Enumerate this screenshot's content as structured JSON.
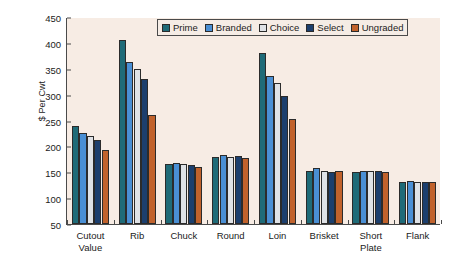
{
  "chart_data": {
    "type": "bar",
    "title": "",
    "subtitle": "",
    "xlabel": "",
    "ylabel": "$ Per Cwt",
    "ylim": [
      50,
      450
    ],
    "yticks": [
      50,
      100,
      150,
      200,
      250,
      300,
      350,
      400,
      450
    ],
    "grid": false,
    "legend_position": "top-center",
    "categories": [
      "Cutout\nValue",
      "Rib",
      "Chuck",
      "Round",
      "Loin",
      "Brisket",
      "Short\nPlate",
      "Flank"
    ],
    "series": [
      {
        "name": "Prime",
        "color": "#1f6b78",
        "values": [
          239,
          405,
          166,
          179,
          381,
          152,
          151,
          132
        ]
      },
      {
        "name": "Branded",
        "color": "#4a8fd4",
        "values": [
          225,
          363,
          167,
          183,
          336,
          159,
          152,
          133
        ]
      },
      {
        "name": "Choice",
        "color": "#dfe2e6",
        "values": [
          220,
          349,
          166,
          180,
          323,
          152,
          152,
          132
        ]
      },
      {
        "name": "Select",
        "color": "#1c3f6e",
        "values": [
          212,
          331,
          165,
          181,
          297,
          151,
          152,
          132
        ]
      },
      {
        "name": "Ungraded",
        "color": "#c1622c",
        "values": [
          193,
          260,
          160,
          178,
          253,
          153,
          151,
          131
        ]
      }
    ]
  },
  "colors": {
    "plot_background": "#f7ece4",
    "page_background": "#ffffff",
    "axis": "#4a4a4a",
    "text": "#1b1b1b",
    "bar_outline": "#2b2b2b"
  }
}
